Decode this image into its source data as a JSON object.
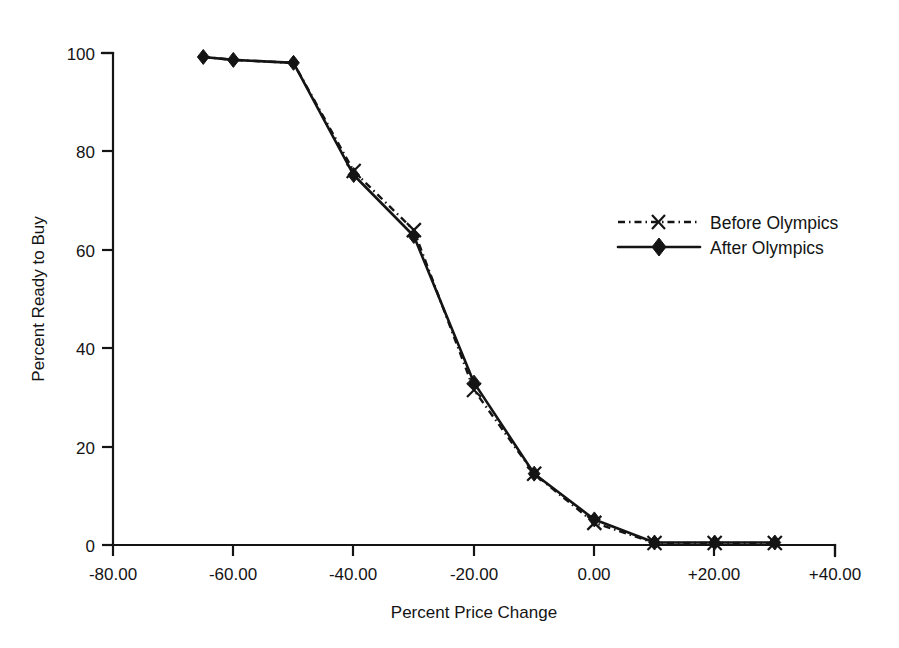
{
  "chart_data": {
    "type": "line",
    "title": "",
    "subtitle": "",
    "xlabel": "Percent Price Change",
    "ylabel": "Percent Ready to Buy",
    "xlim": [
      -80,
      40
    ],
    "ylim": [
      0,
      100
    ],
    "grid": false,
    "legend_position": "right-middle",
    "x_ticks": [
      -80,
      -60,
      -40,
      -20,
      0,
      20,
      40
    ],
    "x_tick_labels": [
      "-80.00",
      "-60.00",
      "-40.00",
      "-20.00",
      "0.00",
      "+20.00",
      "+40.00"
    ],
    "y_ticks": [
      0,
      20,
      40,
      60,
      80,
      100
    ],
    "y_tick_labels": [
      "0",
      "20",
      "40",
      "60",
      "80",
      "100"
    ],
    "x": [
      -65,
      -60,
      -50,
      -40,
      -30,
      -20,
      -10,
      0,
      10,
      20,
      30
    ],
    "series": [
      {
        "name": "Before Olympics",
        "marker": "x",
        "line_style": "dash-dot",
        "color": "#141414",
        "values": [
          99.2,
          98.6,
          98.0,
          76.0,
          64.0,
          31.5,
          14.5,
          4.5,
          0.4,
          0.4,
          0.4
        ]
      },
      {
        "name": "After Olympics",
        "marker": "diamond",
        "line_style": "solid",
        "color": "#141414",
        "values": [
          99.2,
          98.6,
          98.0,
          75.2,
          62.8,
          33.0,
          14.5,
          5.2,
          0.5,
          0.5,
          0.5
        ]
      }
    ]
  },
  "legend": {
    "entries": [
      {
        "label": "Before Olympics",
        "marker": "x",
        "style": "dash-dot"
      },
      {
        "label": "After Olympics",
        "marker": "diamond",
        "style": "solid"
      }
    ]
  },
  "axes": {
    "x_title": "Percent Price Change",
    "y_title": "Percent Ready to Buy"
  }
}
